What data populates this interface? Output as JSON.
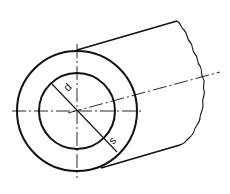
{
  "diagram": {
    "labels": {
      "inner_diameter": "d",
      "wall_thickness": "s"
    },
    "colors": {
      "line": "#111111",
      "background": "#ffffff"
    }
  }
}
